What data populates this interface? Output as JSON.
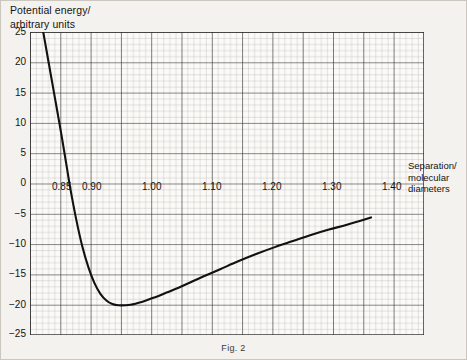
{
  "figure": {
    "caption": "Fig. 2"
  },
  "axes": {
    "y_title": "Potential energy/\narbitrary units",
    "x_title": "Separation/\nmolecular\ndiameters"
  },
  "chart_data": {
    "type": "line",
    "title": "Fig. 2",
    "xlabel": "Separation/ molecular diameters",
    "ylabel": "Potential energy/ arbitrary units",
    "xlim": [
      0.833,
      1.488
    ],
    "ylim": [
      -25,
      25
    ],
    "grid": true,
    "minor_grid": true,
    "legend": "none",
    "x_major_ticks": [
      0.85,
      0.9,
      0.95,
      1.0,
      1.05,
      1.1,
      1.15,
      1.2,
      1.25,
      1.3,
      1.35,
      1.4,
      1.45
    ],
    "x_tick_labels": [
      "0.85",
      "0.90",
      "",
      "1.00",
      "",
      "1.10",
      "",
      "1.20",
      "",
      "1.30",
      "",
      "1.40",
      ""
    ],
    "y_major_ticks": [
      25,
      20,
      15,
      10,
      5,
      0,
      -5,
      -10,
      -15,
      -20,
      -25
    ],
    "y_tick_labels": [
      "25",
      "20",
      "15",
      "10",
      "5",
      "0",
      "-5",
      "-10",
      "-15",
      "-20",
      "-25"
    ],
    "x": [
      0.855,
      0.86,
      0.865,
      0.87,
      0.875,
      0.88,
      0.885,
      0.89,
      0.895,
      0.9,
      0.91,
      0.92,
      0.93,
      0.94,
      0.95,
      0.96,
      0.97,
      0.98,
      1.0,
      1.02,
      1.04,
      1.06,
      1.08,
      1.1,
      1.12,
      1.15,
      1.18,
      1.21,
      1.24,
      1.27,
      1.3,
      1.33,
      1.36,
      1.4
    ],
    "values": [
      25.0,
      22.2,
      19.4,
      16.6,
      13.8,
      11.0,
      8.2,
      5.2,
      2.2,
      -0.8,
      -6.0,
      -10.4,
      -13.8,
      -16.4,
      -18.2,
      -19.3,
      -19.9,
      -20.1,
      -20.0,
      -19.5,
      -18.8,
      -18.0,
      -17.2,
      -16.3,
      -15.4,
      -14.1,
      -12.8,
      -11.6,
      -10.5,
      -9.5,
      -8.5,
      -7.6,
      -6.8,
      -5.6
    ],
    "minimum": {
      "x": 0.985,
      "y": -20.1
    },
    "zero_crossing": {
      "x": 0.897,
      "y": 0
    },
    "endpoint": {
      "x": 1.4,
      "y": -5.6
    }
  },
  "ticks": {
    "y": [
      {
        "label": "25",
        "top": 26
      },
      {
        "label": "20",
        "top": 56
      },
      {
        "label": "15",
        "top": 87
      },
      {
        "label": "10",
        "top": 117
      },
      {
        "label": "5",
        "top": 147
      },
      {
        "label": "0",
        "top": 177
      },
      {
        "label": "−5",
        "top": 208
      },
      {
        "label": "−10",
        "top": 238
      },
      {
        "label": "−15",
        "top": 268
      },
      {
        "label": "−20",
        "top": 299
      },
      {
        "label": "−25",
        "top": 328
      }
    ],
    "x": [
      {
        "label": "0.85",
        "left": 22
      },
      {
        "label": "0.90",
        "left": 52
      },
      {
        "label": "1.00",
        "left": 112
      },
      {
        "label": "1.10",
        "left": 172
      },
      {
        "label": "1.20",
        "left": 232
      },
      {
        "label": "1.30",
        "left": 292
      },
      {
        "label": "1.40",
        "left": 352
      }
    ]
  }
}
